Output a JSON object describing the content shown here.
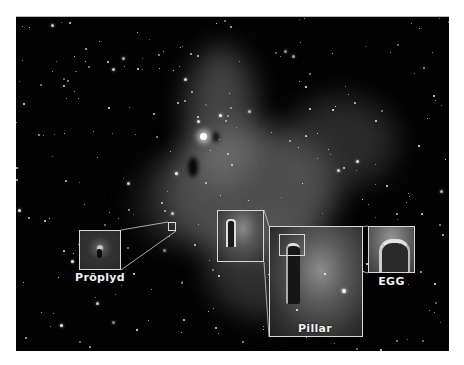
{
  "image": {
    "subject": "emission nebula star field with zoomed insets",
    "background_color": "#030303",
    "frame_color": "#d8d8d8"
  },
  "insets": [
    {
      "id": "proplyd",
      "label": "Pröplyd",
      "box": {
        "x": 79,
        "y": 230,
        "w": 42,
        "h": 40
      },
      "source_box": {
        "x": 168,
        "y": 222,
        "w": 8,
        "h": 9
      }
    },
    {
      "id": "pillar-overview",
      "label": "",
      "box": {
        "x": 217,
        "y": 210,
        "w": 47,
        "h": 52
      }
    },
    {
      "id": "pillar",
      "label": "Pillar",
      "box": {
        "x": 269,
        "y": 226,
        "w": 94,
        "h": 111
      },
      "source_box": {
        "x": 279,
        "y": 234,
        "w": 26,
        "h": 22
      }
    },
    {
      "id": "egg",
      "label": "EGG",
      "box": {
        "x": 368,
        "y": 226,
        "w": 47,
        "h": 47
      }
    }
  ],
  "labels": {
    "proplyd": "Pröplyd",
    "pillar": "Pillar",
    "egg": "EGG"
  }
}
